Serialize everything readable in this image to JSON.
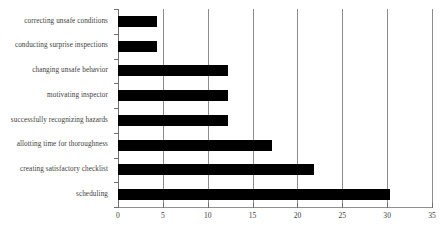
{
  "chart_data": {
    "type": "bar",
    "orientation": "horizontal",
    "title": "",
    "subtitle": "",
    "xlabel": "",
    "ylabel": "",
    "categories": [
      "correcting unsafe conditions",
      "conducting surprise inspections",
      "changing unsafe behavior",
      "motivating inspector",
      "successfully recognizing hazards",
      "allotting time for thoroughness",
      "creating satisfactory checklist",
      "scheduling"
    ],
    "values": [
      4.4,
      4.4,
      12.3,
      12.3,
      12.3,
      17.2,
      21.8,
      30.3
    ],
    "xlim": [
      0,
      35
    ],
    "xticks": [
      0,
      5,
      10,
      15,
      20,
      25,
      30,
      35
    ],
    "xtick_labels": [
      "0",
      "5",
      "10",
      "15",
      "20",
      "25",
      "30",
      "35"
    ],
    "grid": true,
    "grid_axis": "x",
    "legend": false,
    "bar_color": "#000000",
    "grid_color": "#8c8c8c",
    "axis_color": "#6e6e6e",
    "background": "#ffffff"
  }
}
